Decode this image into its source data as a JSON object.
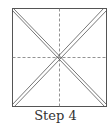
{
  "figure": {
    "caption": "Step 4",
    "type": "origami-fold-diagram",
    "square": {
      "x": 12,
      "y": 8,
      "size": 95
    },
    "colors": {
      "line": "#555555",
      "dashed": "#777777",
      "background": "#ffffff"
    },
    "elements": [
      {
        "kind": "outline",
        "shape": "square"
      },
      {
        "kind": "valley-fold",
        "style": "dashed",
        "orientation": "vertical-center"
      },
      {
        "kind": "valley-fold",
        "style": "dashed",
        "orientation": "horizontal-center"
      },
      {
        "kind": "crease",
        "style": "double-line",
        "orientation": "diagonal-top-left-to-bottom-right"
      },
      {
        "kind": "crease",
        "style": "double-line",
        "orientation": "diagonal-top-right-to-bottom-left"
      }
    ]
  }
}
